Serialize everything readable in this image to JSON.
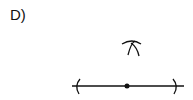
{
  "question": {
    "option_label": "D)"
  },
  "diagram": {
    "type": "geometric-construction",
    "stroke_color": "#111111",
    "elements": {
      "segment": {
        "x1": 72,
        "y1": 86,
        "x2": 184,
        "y2": 86
      },
      "left_arc": {
        "cx": 77,
        "cy": 86
      },
      "right_arc": {
        "cx": 176,
        "cy": 86
      },
      "midpoint": {
        "cx": 127,
        "cy": 86,
        "r": 2.5
      },
      "intersecting_arcs": {
        "cx": 130,
        "cy": 46
      }
    }
  }
}
